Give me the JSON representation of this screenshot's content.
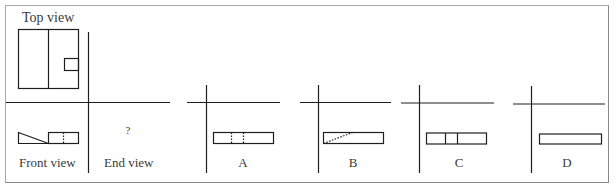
{
  "title_label": "Top view",
  "views": {
    "front": "Front view",
    "end": "End view",
    "end_placeholder": "?"
  },
  "options": [
    {
      "id": "A",
      "label": "A",
      "description": "rectangle with two vertical dashed lines"
    },
    {
      "id": "B",
      "label": "B",
      "description": "rectangle with diagonal dashed line"
    },
    {
      "id": "C",
      "label": "C",
      "description": "rectangle with two vertical solid lines"
    },
    {
      "id": "D",
      "label": "D",
      "description": "plain rectangle"
    }
  ],
  "colors": {
    "line": "#1e1e1e",
    "frame": "#a8a8a8",
    "text": "#3a3a3a"
  }
}
